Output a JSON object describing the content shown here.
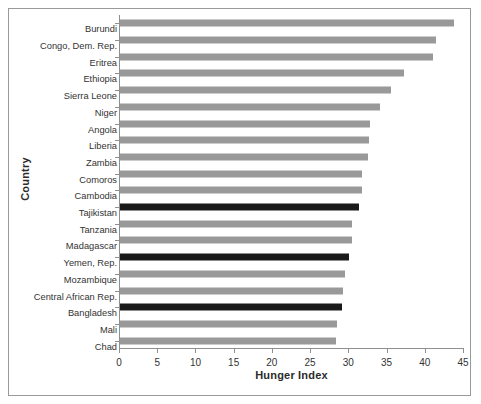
{
  "chart_data": {
    "type": "bar",
    "orientation": "horizontal",
    "title": "",
    "xlabel": "Hunger Index",
    "ylabel": "Country",
    "xlim": [
      0,
      45
    ],
    "xticks": [
      0,
      5,
      10,
      15,
      20,
      25,
      30,
      35,
      40,
      45
    ],
    "grid": false,
    "legend": "none",
    "categories": [
      "Burundi",
      "Congo, Dem. Rep.",
      "Eritrea",
      "Ethiopia",
      "Sierra Leone",
      "Niger",
      "Angola",
      "Liberia",
      "Zambia",
      "Comoros",
      "Cambodia",
      "Tajikistan",
      "Tanzania",
      "Madagascar",
      "Yemen, Rep.",
      "Mozambique",
      "Central African Rep.",
      "Bangladesh",
      "Mali",
      "Chad"
    ],
    "values": [
      43.7,
      41.4,
      41.0,
      37.1,
      35.5,
      34.0,
      32.7,
      32.6,
      32.5,
      31.6,
      31.6,
      31.2,
      30.3,
      30.3,
      30.0,
      29.4,
      29.2,
      29.1,
      28.4,
      28.3
    ],
    "bar_colors": [
      "#999999",
      "#999999",
      "#999999",
      "#999999",
      "#999999",
      "#999999",
      "#999999",
      "#999999",
      "#999999",
      "#999999",
      "#999999",
      "#1a1a1a",
      "#999999",
      "#999999",
      "#1a1a1a",
      "#999999",
      "#999999",
      "#1a1a1a",
      "#999999",
      "#999999"
    ],
    "highlighted_categories": [
      "Tajikistan",
      "Yemen, Rep.",
      "Bangladesh"
    ],
    "colors": {
      "bar_default": "#999999",
      "bar_highlight": "#1a1a1a",
      "axis": "#8f8f8f",
      "text": "#333333",
      "frame": "#9a9a9a",
      "background": "#ffffff"
    }
  }
}
